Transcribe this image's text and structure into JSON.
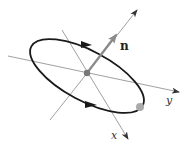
{
  "diagram": {
    "labels": {
      "normal": "n",
      "x_axis": "x",
      "y_axis": "y"
    },
    "colors": {
      "axis": "#888888",
      "ellipse": "#1a1a1a",
      "normal_vector": "#8a8a8a",
      "center_point": "#777777",
      "marker_point": "#aaaaaa"
    },
    "elements": [
      "y-axis line with arrow",
      "x-axis line with arrow",
      "normal axis line with arrow",
      "oriented ellipse (loop) with two direction arrows",
      "normal vector n from center",
      "center point",
      "point on loop"
    ]
  }
}
